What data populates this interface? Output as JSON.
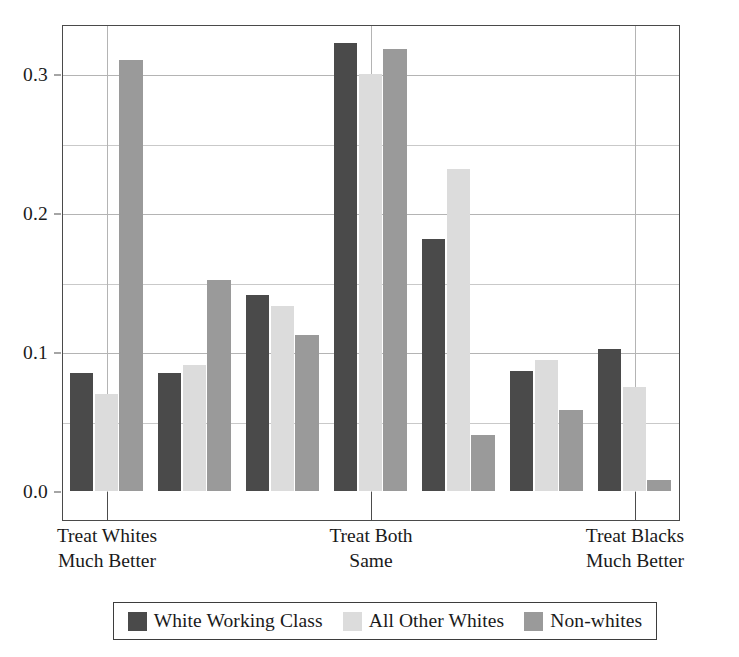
{
  "chart_data": {
    "type": "bar",
    "title": "",
    "subtitle": "",
    "xlabel": "",
    "ylabel": "",
    "grid": true,
    "legend_position": "bottom",
    "bar_mode": "grouped",
    "x": [
      1,
      2,
      3,
      4,
      5,
      6,
      7
    ],
    "categories": [
      "1",
      "2",
      "3",
      "4",
      "5",
      "6",
      "7"
    ],
    "category_axis_labels": [
      {
        "position": 1,
        "line1": "Treat Whites",
        "line2": "Much Better"
      },
      {
        "position": 4,
        "line1": "Treat Both",
        "line2": "Same"
      },
      {
        "position": 7,
        "line1": "Treat Blacks",
        "line2": "Much Better"
      }
    ],
    "ylim": [
      0.0,
      0.341
    ],
    "yticks": [
      0.0,
      0.1,
      0.2,
      0.3
    ],
    "ytick_labels": [
      "0.0",
      "0.1",
      "0.2",
      "0.3"
    ],
    "yminor_gridlines": [
      0.05,
      0.15,
      0.25
    ],
    "series": [
      {
        "name": "White Working Class",
        "color": "#4a4a4a",
        "values": [
          0.085,
          0.085,
          0.141,
          0.322,
          0.181,
          0.086,
          0.102
        ]
      },
      {
        "name": "All Other Whites",
        "color": "#dcdcdc",
        "values": [
          0.07,
          0.091,
          0.133,
          0.3,
          0.232,
          0.094,
          0.075
        ]
      },
      {
        "name": "Non-whites",
        "color": "#9a9a9a",
        "values": [
          0.31,
          0.152,
          0.112,
          0.318,
          0.04,
          0.058,
          0.008
        ]
      }
    ]
  },
  "axis": {
    "y_tick_labels": [
      "0.0",
      "0.1",
      "0.2",
      "0.3"
    ],
    "x_group_labels": [
      {
        "line1": "Treat Whites",
        "line2": "Much Better"
      },
      {
        "line1": "Treat Both",
        "line2": "Same"
      },
      {
        "line1": "Treat Blacks",
        "line2": "Much Better"
      }
    ]
  },
  "legend": {
    "items": [
      {
        "label": "White Working Class",
        "color": "#4a4a4a"
      },
      {
        "label": "All Other Whites",
        "color": "#dcdcdc"
      },
      {
        "label": "Non-whites",
        "color": "#9a9a9a"
      }
    ]
  },
  "colors": {
    "series_dark": "#4a4a4a",
    "series_light": "#dcdcdc",
    "series_medium": "#9a9a9a",
    "frame": "#4a4a4a",
    "gridline": "#b4b4b4",
    "background": "#ffffff",
    "text": "#1a1a1a"
  }
}
